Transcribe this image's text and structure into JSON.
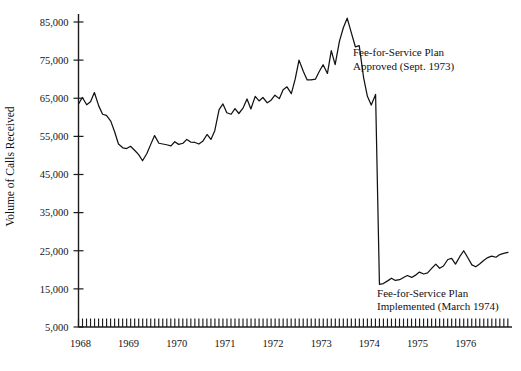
{
  "chart_data": {
    "type": "line",
    "title": "",
    "xlabel": "",
    "ylabel": "Volume of Calls Received",
    "ylim": [
      5000,
      85000
    ],
    "ytick_labels": [
      "5,000",
      "15,000",
      "25,000",
      "35,000",
      "45,000",
      "55,000",
      "65,000",
      "75,000",
      "85,000"
    ],
    "ytick_values": [
      5000,
      15000,
      25000,
      35000,
      45000,
      55000,
      65000,
      75000,
      85000
    ],
    "xtick_labels": [
      "1968",
      "1969",
      "1970",
      "1971",
      "1972",
      "1973",
      "1974",
      "1975",
      "1976"
    ],
    "xtick_values": [
      1968,
      1969,
      1970,
      1971,
      1972,
      1973,
      1974,
      1975,
      1976
    ],
    "xlim": [
      1968,
      1976.92
    ],
    "grid": false,
    "legend": "none",
    "minor_ticks": "monthly",
    "annotations": [
      {
        "name": "fee-for-service-approved",
        "line1": "Fee-for-Service Plan",
        "line2": "Approved (Sept. 1973)",
        "x": 1973.7,
        "y": 76000
      },
      {
        "name": "fee-for-service-implemented",
        "line1": "Fee-for-Service Plan",
        "line2": "Implemented (March 1974)",
        "x": 1974.2,
        "y": 13000
      }
    ],
    "series": [
      {
        "name": "Volume of Calls Received",
        "x": [
          1968.0,
          1968.08,
          1968.17,
          1968.25,
          1968.33,
          1968.42,
          1968.5,
          1968.58,
          1968.67,
          1968.75,
          1968.83,
          1968.92,
          1969.0,
          1969.08,
          1969.17,
          1969.25,
          1969.33,
          1969.42,
          1969.5,
          1969.58,
          1969.67,
          1969.75,
          1969.83,
          1969.92,
          1970.0,
          1970.08,
          1970.17,
          1970.25,
          1970.33,
          1970.42,
          1970.5,
          1970.58,
          1970.67,
          1970.75,
          1970.83,
          1970.92,
          1971.0,
          1971.08,
          1971.17,
          1971.25,
          1971.33,
          1971.42,
          1971.5,
          1971.58,
          1971.67,
          1971.75,
          1971.83,
          1971.92,
          1972.0,
          1972.08,
          1972.17,
          1972.25,
          1972.33,
          1972.42,
          1972.5,
          1972.58,
          1972.67,
          1972.75,
          1972.83,
          1972.92,
          1973.0,
          1973.08,
          1973.17,
          1973.25,
          1973.33,
          1973.42,
          1973.5,
          1973.58,
          1973.67,
          1973.75,
          1973.83,
          1973.92,
          1974.0,
          1974.08,
          1974.17,
          1974.25,
          1974.33,
          1974.42,
          1974.5,
          1974.58,
          1974.67,
          1974.75,
          1974.83,
          1974.92,
          1975.0,
          1975.08,
          1975.17,
          1975.25,
          1975.33,
          1975.42,
          1975.5,
          1975.58,
          1975.67,
          1975.75,
          1975.83,
          1975.92,
          1976.0,
          1976.08,
          1976.17,
          1976.25,
          1976.33,
          1976.42,
          1976.5,
          1976.58,
          1976.67,
          1976.75,
          1976.83,
          1976.92
        ],
        "values": [
          63500,
          65200,
          63300,
          64100,
          66500,
          63000,
          60800,
          60500,
          59000,
          56200,
          53000,
          52000,
          51800,
          52400,
          51300,
          50200,
          48600,
          50500,
          52900,
          55200,
          53200,
          53000,
          52800,
          52500,
          53600,
          52900,
          53200,
          54200,
          53500,
          53400,
          53000,
          53700,
          55500,
          54200,
          56500,
          62000,
          63500,
          61200,
          60800,
          62300,
          61000,
          62500,
          64800,
          62200,
          65500,
          64300,
          65200,
          63800,
          64500,
          65800,
          64900,
          67200,
          68000,
          66200,
          70000,
          75000,
          72000,
          69800,
          69800,
          70000,
          72000,
          73800,
          71500,
          77500,
          73800,
          80000,
          83500,
          86000,
          82000,
          78500,
          78800,
          70500,
          65500,
          63200,
          66000,
          16200,
          16400,
          17100,
          17800,
          17200,
          17400,
          18000,
          18500,
          18000,
          18600,
          19400,
          18900,
          19200,
          20300,
          21500,
          20400,
          21000,
          22700,
          23000,
          21500,
          23500,
          25000,
          23300,
          21300,
          20800,
          21500,
          22500,
          23200,
          23600,
          23300,
          24000,
          24300,
          24600
        ]
      }
    ]
  }
}
